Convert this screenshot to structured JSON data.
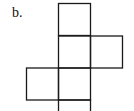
{
  "label": "b.",
  "diagram": {
    "type": "cube-net",
    "stroke_color": "#1a1a1a",
    "square_size": 32,
    "squares": [
      {
        "name": "top",
        "x": 58.5,
        "y": 3.5
      },
      {
        "name": "middle-center",
        "x": 58.5,
        "y": 36
      },
      {
        "name": "middle-right",
        "x": 90.5,
        "y": 36
      },
      {
        "name": "lower-center",
        "x": 58.5,
        "y": 68
      },
      {
        "name": "lower-left",
        "x": 26.5,
        "y": 68
      },
      {
        "name": "bottom",
        "x": 58.5,
        "y": 100
      }
    ]
  }
}
